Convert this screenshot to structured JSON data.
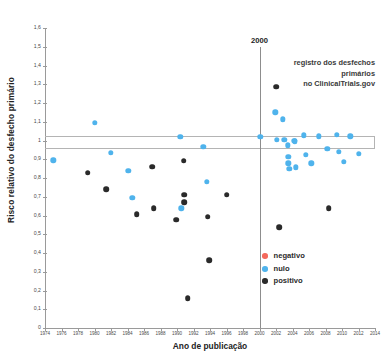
{
  "chart_data": {
    "type": "scatter",
    "title": "",
    "xlabel": "Ano de publicação",
    "ylabel": "Risco relativo do desfecho primário",
    "xlim": [
      1974,
      2014
    ],
    "ylim": [
      0,
      1.6
    ],
    "grid": false,
    "xticks": [
      1974,
      1976,
      1978,
      1980,
      1982,
      1984,
      1986,
      1988,
      1990,
      1992,
      1994,
      1996,
      1998,
      2000,
      2002,
      2004,
      2006,
      2008,
      2010,
      2012,
      2014
    ],
    "xticklabels": [
      "1974",
      "1976",
      "1978",
      "1980",
      "1982",
      "1984",
      "1986",
      "1988",
      "1990",
      "1992",
      "1994",
      "1996",
      "1998",
      "2000",
      "2002",
      "2004",
      "2006",
      "2008",
      "2010",
      "2012",
      "2014"
    ],
    "yticks": [
      0,
      0.1,
      0.2,
      0.3,
      0.4,
      0.5,
      0.6,
      0.7,
      0.8,
      0.9,
      1.0,
      1.1,
      1.2,
      1.3,
      1.4,
      1.5,
      1.6
    ],
    "yticklabels": [
      "0",
      "0,1",
      "0,2",
      "0,3",
      "0,4",
      "0,5",
      "0,6",
      "0,7",
      "0,8",
      "0,9",
      "1",
      "1,1",
      "1,2",
      "1,3",
      "1,4",
      "1,5",
      "1,6"
    ],
    "legend_position": "lower-right",
    "series": [
      {
        "name": "negativo",
        "color": "#f4685c",
        "points": []
      },
      {
        "name": "nulo",
        "color": "#4fb3ec",
        "points": [
          {
            "x": 1975.0,
            "y": 0.895
          },
          {
            "x": 1980.0,
            "y": 1.093
          },
          {
            "x": 1982.0,
            "y": 0.935
          },
          {
            "x": 1984.1,
            "y": 0.838
          },
          {
            "x": 1984.6,
            "y": 0.693
          },
          {
            "x": 1990.4,
            "y": 1.02
          },
          {
            "x": 1990.5,
            "y": 0.638
          },
          {
            "x": 1993.2,
            "y": 0.968
          },
          {
            "x": 1993.6,
            "y": 0.78
          },
          {
            "x": 2000.1,
            "y": 1.02
          },
          {
            "x": 2001.9,
            "y": 1.15
          },
          {
            "x": 2002.8,
            "y": 1.113
          },
          {
            "x": 2002.1,
            "y": 1.005
          },
          {
            "x": 2003.0,
            "y": 1.003
          },
          {
            "x": 2003.4,
            "y": 0.975
          },
          {
            "x": 2003.5,
            "y": 0.913
          },
          {
            "x": 2003.5,
            "y": 0.878
          },
          {
            "x": 2003.6,
            "y": 0.848
          },
          {
            "x": 2004.2,
            "y": 1.0
          },
          {
            "x": 2004.3,
            "y": 0.995
          },
          {
            "x": 2004.4,
            "y": 0.857
          },
          {
            "x": 2005.4,
            "y": 1.027
          },
          {
            "x": 2005.6,
            "y": 0.925
          },
          {
            "x": 2006.3,
            "y": 0.878
          },
          {
            "x": 2007.2,
            "y": 1.022
          },
          {
            "x": 2008.2,
            "y": 0.955
          },
          {
            "x": 2009.4,
            "y": 1.03
          },
          {
            "x": 2009.6,
            "y": 0.94
          },
          {
            "x": 2010.2,
            "y": 0.885
          },
          {
            "x": 2011.0,
            "y": 1.023
          },
          {
            "x": 2012.0,
            "y": 0.928
          }
        ]
      },
      {
        "name": "positivo",
        "color": "#2a2a2a",
        "points": [
          {
            "x": 1979.2,
            "y": 0.828
          },
          {
            "x": 1981.4,
            "y": 0.74
          },
          {
            "x": 1985.1,
            "y": 0.607
          },
          {
            "x": 1987.0,
            "y": 0.86
          },
          {
            "x": 1987.2,
            "y": 0.638
          },
          {
            "x": 1989.9,
            "y": 0.578
          },
          {
            "x": 1990.8,
            "y": 0.893
          },
          {
            "x": 1990.9,
            "y": 0.71
          },
          {
            "x": 1990.9,
            "y": 0.672
          },
          {
            "x": 1991.3,
            "y": 0.158
          },
          {
            "x": 1993.7,
            "y": 0.593
          },
          {
            "x": 1993.9,
            "y": 0.363
          },
          {
            "x": 1996.0,
            "y": 0.712
          },
          {
            "x": 2002.0,
            "y": 1.288
          },
          {
            "x": 2002.4,
            "y": 0.537
          },
          {
            "x": 2008.4,
            "y": 0.64
          }
        ]
      }
    ],
    "reference_band": {
      "upper": 1.022,
      "lower": 0.968
    },
    "annotations": [
      {
        "name": "year-marker-label",
        "text": "2000",
        "x": 2000,
        "y": 1.555
      },
      {
        "name": "registry-note",
        "text_lines": [
          "registro dos desfechos primários",
          "no ClinicalTrials.gov"
        ],
        "x": 2000,
        "y": 1.44
      }
    ],
    "vline": {
      "x": 2000,
      "color": "#8d8d8d"
    }
  },
  "legend": {
    "items": [
      {
        "label": "negativo",
        "color": "#f4685c"
      },
      {
        "label": "nulo",
        "color": "#4fb3ec"
      },
      {
        "label": "positivo",
        "color": "#2a2a2a"
      }
    ]
  },
  "axes": {
    "x_title": "Ano de publicação",
    "y_title": "Risco relativo do desfecho primário"
  },
  "annotation": {
    "year": "2000",
    "line1": "registro dos desfechos primários",
    "line2": "no ClinicalTrials.gov"
  }
}
